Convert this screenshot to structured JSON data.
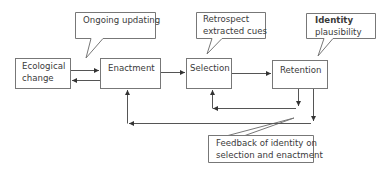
{
  "boxes": {
    "ecological_change": {
      "line1": "Ecological",
      "line2": "change"
    },
    "enactment": {
      "label": "Enactment"
    },
    "selection": {
      "label": "Selection"
    },
    "retention": {
      "label": "Retention"
    }
  },
  "callouts": {
    "ongoing_updating": {
      "label": "Ongoing updating"
    },
    "retrospect": {
      "line1": "Retrospect",
      "line2": "extracted cues"
    },
    "identity": {
      "line1_bold": "Identity",
      "line2": "plausibility"
    },
    "feedback": {
      "line1": "Feedback of identity on",
      "line2": "selection and enactment"
    }
  },
  "colors": {
    "stroke": "#555555",
    "text": "#3a3a3a",
    "background": "#ffffff"
  }
}
